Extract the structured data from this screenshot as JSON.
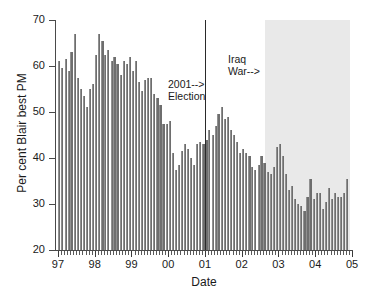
{
  "chart_data": {
    "type": "bar",
    "title": "",
    "xlabel": "Date",
    "ylabel": "Per cent Blair best PM",
    "ylim": [
      20,
      70
    ],
    "ytick_labels": [
      "20",
      "30",
      "40",
      "50",
      "60",
      "70"
    ],
    "ytick_values": [
      20,
      30,
      40,
      50,
      60,
      70
    ],
    "xtick_labels": [
      "97",
      "98",
      "99",
      "00",
      "01",
      "02",
      "03",
      "04",
      "05"
    ],
    "xtick_values": [
      1997,
      1998,
      1999,
      2000,
      2001,
      2002,
      2003,
      2004,
      2005
    ],
    "xlim": [
      1996.92,
      2005.0
    ],
    "grid": false,
    "legend": null,
    "bar_color": "#6e6e6e",
    "shade_color": "#e9e9e9",
    "series_name": "Per cent Blair best PM",
    "x": [
      1997.04,
      1997.12,
      1997.21,
      1997.29,
      1997.37,
      1997.46,
      1997.54,
      1997.62,
      1997.71,
      1997.79,
      1997.87,
      1997.96,
      1998.04,
      1998.12,
      1998.21,
      1998.29,
      1998.37,
      1998.46,
      1998.54,
      1998.62,
      1998.71,
      1998.79,
      1998.87,
      1998.96,
      1999.04,
      1999.12,
      1999.21,
      1999.29,
      1999.37,
      1999.46,
      1999.54,
      1999.62,
      1999.71,
      1999.79,
      1999.87,
      1999.96,
      2000.04,
      2000.12,
      2000.21,
      2000.29,
      2000.37,
      2000.46,
      2000.54,
      2000.62,
      2000.71,
      2000.79,
      2000.87,
      2000.96,
      2001.04,
      2001.12,
      2001.21,
      2001.29,
      2001.37,
      2001.46,
      2001.54,
      2001.62,
      2001.71,
      2001.79,
      2001.87,
      2001.96,
      2002.04,
      2002.12,
      2002.21,
      2002.29,
      2002.37,
      2002.46,
      2002.54,
      2002.62,
      2002.71,
      2002.79,
      2002.87,
      2002.96,
      2003.04,
      2003.12,
      2003.21,
      2003.29,
      2003.37,
      2003.46,
      2003.54,
      2003.62,
      2003.71,
      2003.79,
      2003.87,
      2003.96,
      2004.04,
      2004.12,
      2004.21,
      2004.29,
      2004.37,
      2004.46,
      2004.54,
      2004.62,
      2004.71,
      2004.79,
      2004.87
    ],
    "values": [
      61.0,
      59.5,
      61.5,
      59.0,
      63.0,
      67.0,
      57.5,
      55.0,
      53.5,
      51.0,
      55.0,
      56.0,
      62.5,
      67.0,
      65.5,
      62.5,
      63.5,
      61.0,
      62.0,
      60.5,
      58.0,
      61.0,
      60.5,
      62.0,
      59.0,
      61.0,
      56.5,
      54.5,
      57.0,
      57.5,
      57.5,
      54.0,
      53.0,
      51.5,
      47.5,
      47.5,
      48.0,
      41.0,
      37.5,
      38.5,
      41.5,
      43.0,
      42.0,
      40.0,
      38.5,
      43.0,
      43.5,
      43.0,
      44.0,
      46.0,
      45.0,
      47.0,
      49.5,
      51.0,
      48.5,
      49.0,
      46.0,
      45.0,
      43.5,
      41.0,
      42.0,
      41.0,
      40.5,
      38.0,
      37.5,
      38.5,
      40.5,
      39.0,
      37.0,
      36.5,
      38.0,
      42.5,
      43.0,
      40.5,
      36.5,
      33.0,
      34.0,
      31.0,
      30.0,
      29.5,
      28.5,
      31.5,
      35.5,
      31.0,
      32.5,
      32.5,
      29.0,
      30.5,
      33.5,
      31.0,
      32.5,
      31.5,
      31.5,
      32.5,
      35.5
    ],
    "annotations": [
      {
        "id": "election-2001",
        "lines": [
          "2001-->",
          "Election"
        ],
        "x": 2001.0,
        "kind": "vertical-line-with-label"
      },
      {
        "id": "iraq-war",
        "lines": [
          "Iraq",
          "War-->"
        ],
        "x": 2002.62,
        "kind": "shaded-region-start-with-label"
      }
    ],
    "shaded_regions": [
      {
        "id": "iraq-war-period",
        "x_start": 2002.62,
        "x_end": 2004.95,
        "color": "#e9e9e9"
      }
    ]
  }
}
